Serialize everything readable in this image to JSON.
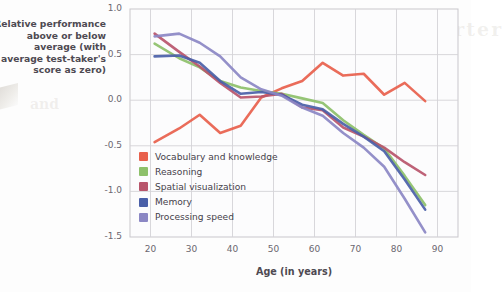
{
  "chart_data": {
    "type": "line",
    "title": "",
    "xlabel": "Age (in years)",
    "ylabel": "Relative performance above or below average (with average test-taker's score as zero)",
    "xlim": [
      15,
      95
    ],
    "ylim": [
      -1.5,
      1.0
    ],
    "xticks": [
      20,
      30,
      40,
      50,
      60,
      70,
      80,
      90
    ],
    "yticks": [
      1.0,
      0.5,
      0.0,
      -0.5,
      -1.0,
      -1.5
    ],
    "ytick_labels": [
      "1.0",
      "0.5",
      "0.0",
      "-0.5",
      "-1.0",
      "-1.5"
    ],
    "xtick_labels": [
      "20",
      "30",
      "40",
      "50",
      "60",
      "70",
      "80",
      "90"
    ],
    "grid": true,
    "legend_position": "inside-lower-left",
    "x": [
      21,
      27,
      32,
      37,
      42,
      47,
      52,
      57,
      62,
      67,
      72,
      77,
      82,
      87
    ],
    "series": [
      {
        "name": "Vocabulary and knowledge",
        "color": "#e8604c",
        "values": [
          -0.46,
          -0.31,
          -0.16,
          -0.36,
          -0.28,
          0.03,
          0.13,
          0.21,
          0.41,
          0.27,
          0.29,
          0.06,
          0.19,
          -0.01
        ]
      },
      {
        "name": "Reasoning",
        "color": "#8dc06a",
        "values": [
          0.62,
          0.46,
          0.36,
          0.21,
          0.14,
          0.1,
          0.07,
          0.02,
          -0.03,
          -0.22,
          -0.38,
          -0.53,
          -0.83,
          -1.15
        ]
      },
      {
        "name": "Spatial visualization",
        "color": "#b8556b",
        "values": [
          0.73,
          0.53,
          0.37,
          0.19,
          0.03,
          0.04,
          0.07,
          -0.08,
          -0.11,
          -0.3,
          -0.4,
          -0.52,
          -0.68,
          -0.82
        ]
      },
      {
        "name": "Memory",
        "color": "#4a5fa8",
        "values": [
          0.48,
          0.49,
          0.41,
          0.21,
          0.07,
          0.09,
          0.06,
          -0.05,
          -0.1,
          -0.26,
          -0.4,
          -0.56,
          -0.87,
          -1.2
        ]
      },
      {
        "name": "Processing speed",
        "color": "#8b87c4",
        "values": [
          0.7,
          0.73,
          0.63,
          0.48,
          0.25,
          0.12,
          0.05,
          -0.08,
          -0.17,
          -0.36,
          -0.52,
          -0.73,
          -1.08,
          -1.45
        ]
      }
    ]
  },
  "ghost_text": {
    "line1": "yourself a little smarter",
    "line2": "wisdom",
    "line3": "younger",
    "line4": "and"
  }
}
